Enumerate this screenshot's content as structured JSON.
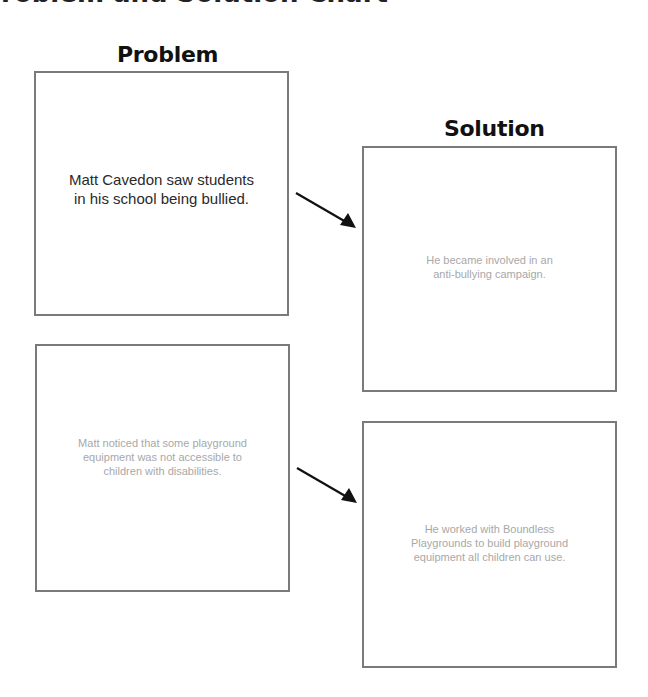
{
  "page": {
    "title": "Problem and Solution Chart"
  },
  "headings": {
    "problem": "Problem",
    "solution": "Solution"
  },
  "rows": [
    {
      "problem": {
        "text": "Matt Cavedon saw students\nin his school being bullied.",
        "style": "prompt"
      },
      "solution": {
        "text": "He became involved in an\nanti-bullying campaign.",
        "style": "answer"
      },
      "arrow": "arrow-right-down-icon"
    },
    {
      "problem": {
        "text": "Matt noticed that some playground\nequipment was not accessible to\nchildren with disabilities.",
        "style": "answer"
      },
      "solution": {
        "text": "He worked with Boundless\nPlaygrounds to build playground\nequipment all children can use.",
        "style": "answer"
      },
      "arrow": "arrow-right-down-icon"
    }
  ],
  "colors": {
    "border": "#7a7a7a",
    "prompt_text": "#2a2a2a",
    "answer_text": "#a8a8a8",
    "heading_text": "#111111",
    "arrow": "#111111"
  }
}
